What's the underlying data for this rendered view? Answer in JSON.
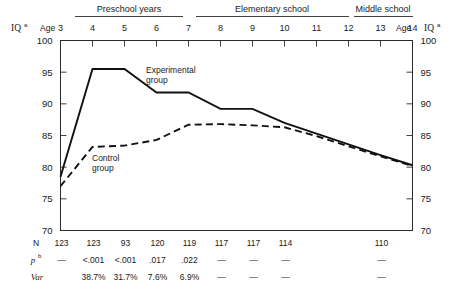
{
  "chart_data": {
    "type": "line",
    "title": "",
    "xlabel": "Age",
    "ylabel": "IQ",
    "ylabel_superscript": "a",
    "xlim": [
      3,
      14
    ],
    "ylim": [
      70,
      100
    ],
    "grid": false,
    "legend": "inline-annotations",
    "x": [
      3,
      4,
      5,
      6,
      7,
      8,
      9,
      10,
      11,
      12,
      13,
      14
    ],
    "xticklabels": [
      "3",
      "4",
      "5",
      "6",
      "7",
      "8",
      "9",
      "10",
      "11",
      "12",
      "13",
      "14"
    ],
    "yticklabels": [
      "100",
      "95",
      "90",
      "85",
      "80",
      "75",
      "70"
    ],
    "yticks": [
      100,
      95,
      90,
      85,
      80,
      75,
      70
    ],
    "series": [
      {
        "name": "Experimental group",
        "style": "solid",
        "values": [
          78.5,
          95.5,
          95.5,
          91.8,
          91.8,
          89.2,
          89.2,
          87.0,
          85.3,
          83.6,
          81.9,
          80.3
        ]
      },
      {
        "name": "Control group",
        "style": "dashed",
        "values": [
          77.0,
          83.2,
          83.4,
          84.3,
          86.7,
          86.8,
          86.6,
          86.3,
          84.9,
          83.3,
          81.7,
          80.2
        ]
      }
    ],
    "annotations": [
      {
        "text": "Experimental",
        "text2": "group",
        "near_x": 6.4,
        "near_y": 94.5
      },
      {
        "text": "Control",
        "text2": "group",
        "near_x": 4.7,
        "near_y": 80.2
      }
    ]
  },
  "header": {
    "bands": [
      {
        "label": "Preschool  years",
        "start_age": 3,
        "end_age": 5
      },
      {
        "label": "Elementary  school",
        "start_age": 6,
        "end_age": 12
      },
      {
        "label": "Middle  school",
        "start_age": 13,
        "end_age": 14
      }
    ],
    "age_word_left": "Age",
    "age_word_right": "Age",
    "iq_label": "IQ",
    "iq_superscript": "a"
  },
  "table": {
    "rows": [
      {
        "key": "N",
        "key_style": "roman",
        "values": [
          "123",
          "123",
          "93",
          "120",
          "119",
          "117",
          "117",
          "114",
          "",
          "",
          "110",
          ""
        ]
      },
      {
        "key": "p",
        "key_superscript": "b",
        "key_style": "italic",
        "values": [
          "—",
          "<.001",
          "<.001",
          ".017",
          ".022",
          "—",
          "—",
          "—",
          "",
          "",
          "—",
          ""
        ]
      },
      {
        "key": "Var",
        "key_style": "italic",
        "values": [
          "",
          "38.7%",
          "31.7%",
          "7.6%",
          "6.9%",
          "—",
          "—",
          "—",
          "",
          "",
          "—",
          ""
        ]
      }
    ]
  },
  "colors": {
    "ink": "#1a1a1a",
    "line": "#111111",
    "frame": "#2b2b2b",
    "background": "#ffffff"
  }
}
